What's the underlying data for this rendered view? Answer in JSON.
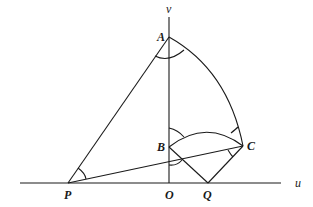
{
  "diagram": {
    "axes": {
      "horizontal_label": "u",
      "vertical_label": "v"
    },
    "points": {
      "A": "A",
      "B": "B",
      "C": "C",
      "O": "O",
      "P": "P",
      "Q": "Q"
    },
    "segments": [
      "PA",
      "PC",
      "BQ",
      "QC",
      "AO (v-axis)",
      "PQ (u-axis)"
    ],
    "arcs": [
      "AC (curved)",
      "BC (curved)"
    ],
    "angle_marks": [
      "at A",
      "at B (above)",
      "at B (below, with PC)",
      "at C (upper)",
      "at C (lower)",
      "at P"
    ]
  }
}
